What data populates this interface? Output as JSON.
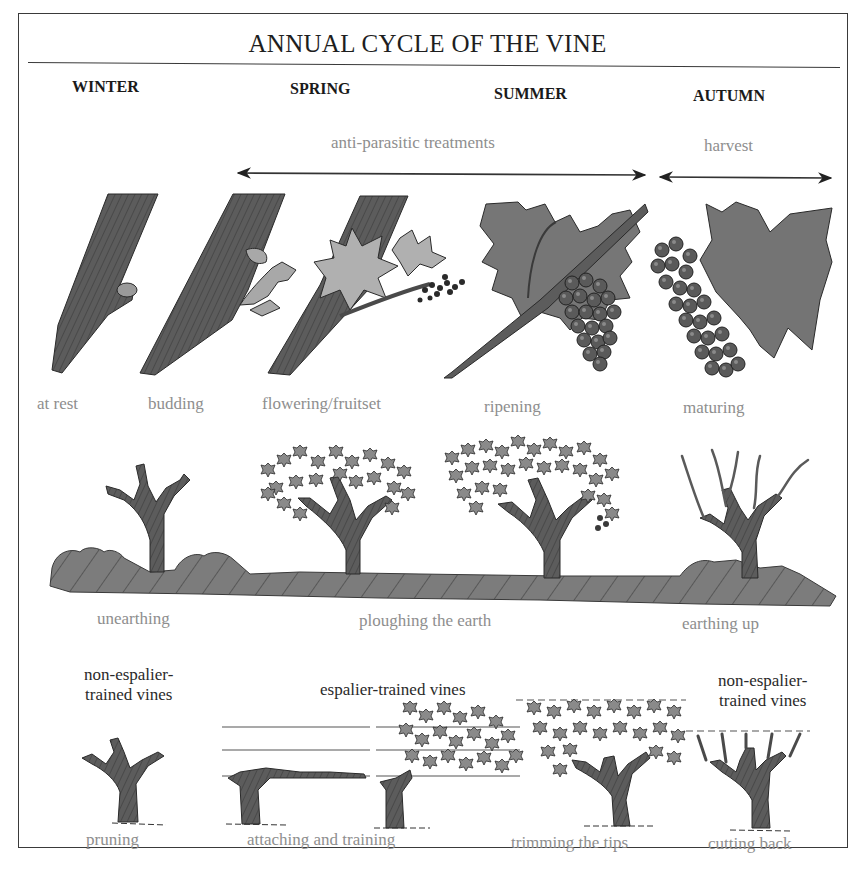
{
  "title": "ANNUAL CYCLE OF THE VINE",
  "seasons": [
    "WINTER",
    "SPRING",
    "SUMMER",
    "AUTUMN"
  ],
  "periods": {
    "treatments": "anti-parasitic treatments",
    "harvest": "harvest"
  },
  "growth_stages": [
    "at rest",
    "budding",
    "flowering/fruitset",
    "ripening",
    "maturing"
  ],
  "soil_work": [
    "unearthing",
    "ploughing the earth",
    "earthing up"
  ],
  "training": {
    "non_espalier_left": [
      "non-espalier-",
      "trained vines"
    ],
    "espalier": "espalier-trained vines",
    "non_espalier_right": [
      "non-espalier-",
      "trained vines"
    ]
  },
  "vine_work": [
    "pruning",
    "attaching and training",
    "trimming the tips",
    "cutting back"
  ],
  "colors": {
    "ink": "#1e1e1e",
    "label_grey": "#8e8e8e",
    "illustration_fill": "#6e6e6e",
    "leaf_light": "#a8a8a8",
    "soil": "#7a7a7a"
  }
}
